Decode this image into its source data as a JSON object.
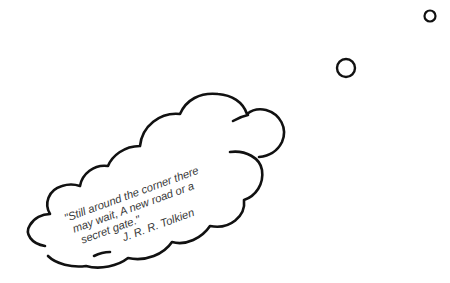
{
  "scene": {
    "background": "#ffffff",
    "stroke_color": "#111111",
    "text_color": "#3a3a3a"
  },
  "thought_bubble": {
    "quote_lines": [
      "\"Still around the corner there",
      "may wait, A new road or a",
      "secret gate.\""
    ],
    "author": "J. R. R. Tolkien",
    "rotation_deg": -20
  },
  "trail_circles": [
    {
      "name": "large",
      "cx": 346,
      "cy": 68,
      "r": 9
    },
    {
      "name": "small",
      "cx": 430,
      "cy": 16,
      "r": 6
    }
  ]
}
